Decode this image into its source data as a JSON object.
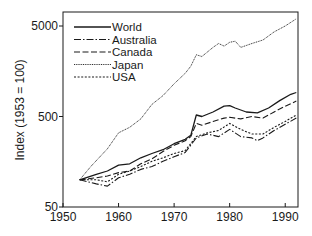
{
  "chart_data": {
    "type": "line",
    "title": "",
    "xlabel": "",
    "ylabel": "Index (1953 = 100)",
    "yscale": "log",
    "xlim": [
      1950,
      1992.3
    ],
    "ylim": [
      50,
      7000
    ],
    "xticks": [
      1950,
      1960,
      1970,
      1980,
      1990
    ],
    "xtick_labels": [
      "1950",
      "1960",
      "1970",
      "1980",
      "1990"
    ],
    "yticks": [
      50,
      500,
      5000
    ],
    "ytick_labels": [
      "50",
      "500",
      "5000"
    ],
    "grid": false,
    "legend_position": "top-left",
    "series": [
      {
        "name": "World",
        "style": "solid",
        "x": [
          1953,
          1956,
          1958,
          1960,
          1962,
          1964,
          1966,
          1968,
          1970,
          1972,
          1973,
          1974,
          1975,
          1977,
          1979,
          1980,
          1981,
          1983,
          1985,
          1987,
          1989,
          1991,
          1992
        ],
        "values": [
          100,
          115,
          125,
          145,
          150,
          175,
          195,
          215,
          250,
          280,
          310,
          520,
          500,
          560,
          650,
          660,
          620,
          560,
          550,
          620,
          750,
          880,
          920
        ]
      },
      {
        "name": "Australia",
        "style": "dashdot",
        "x": [
          1953,
          1956,
          1958,
          1960,
          1962,
          1964,
          1966,
          1968,
          1970,
          1972,
          1974,
          1976,
          1978,
          1980,
          1982,
          1984,
          1985,
          1986,
          1988,
          1990,
          1992
        ],
        "values": [
          100,
          90,
          85,
          105,
          115,
          130,
          140,
          160,
          180,
          200,
          290,
          320,
          300,
          360,
          300,
          290,
          270,
          290,
          350,
          410,
          480
        ]
      },
      {
        "name": "Canada",
        "style": "dashed",
        "x": [
          1953,
          1956,
          1958,
          1960,
          1962,
          1964,
          1966,
          1968,
          1970,
          1972,
          1973,
          1974,
          1975,
          1977,
          1979,
          1980,
          1982,
          1984,
          1986,
          1988,
          1990,
          1992
        ],
        "values": [
          100,
          105,
          110,
          120,
          125,
          150,
          170,
          205,
          240,
          270,
          300,
          420,
          400,
          440,
          480,
          490,
          470,
          500,
          480,
          560,
          650,
          740
        ]
      },
      {
        "name": "Japan",
        "style": "dotted-fine",
        "x": [
          1953,
          1955,
          1958,
          1960,
          1962,
          1964,
          1966,
          1968,
          1970,
          1972,
          1973,
          1974,
          1975,
          1977,
          1978,
          1979,
          1980,
          1981,
          1982,
          1984,
          1986,
          1988,
          1990,
          1992
        ],
        "values": [
          100,
          140,
          220,
          330,
          380,
          470,
          680,
          850,
          1150,
          1500,
          1800,
          2400,
          2300,
          2900,
          3200,
          3000,
          3300,
          3400,
          2900,
          3200,
          3500,
          4300,
          5000,
          6000
        ]
      },
      {
        "name": "USA",
        "style": "dotted",
        "x": [
          1953,
          1956,
          1958,
          1960,
          1962,
          1964,
          1966,
          1968,
          1970,
          1972,
          1974,
          1976,
          1978,
          1980,
          1982,
          1984,
          1986,
          1988,
          1990,
          1992
        ],
        "values": [
          100,
          100,
          95,
          115,
          125,
          140,
          160,
          175,
          195,
          210,
          300,
          330,
          350,
          420,
          360,
          320,
          320,
          380,
          440,
          520
        ]
      }
    ]
  }
}
